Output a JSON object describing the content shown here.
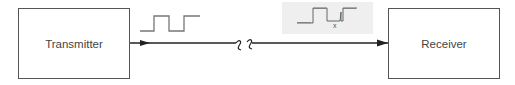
{
  "diagram": {
    "nodes": [
      {
        "id": "transmitter",
        "label": "Transmitter"
      },
      {
        "id": "receiver",
        "label": "Receiver"
      }
    ],
    "edges": [
      {
        "from": "transmitter",
        "to": "receiver",
        "style": "arrow",
        "break": "channel-break (wavy)"
      }
    ],
    "signals": {
      "transmitted": {
        "type": "clean square wave"
      },
      "received": {
        "type": "noisy square wave",
        "marker": "x"
      }
    },
    "colors": {
      "line": "#222222",
      "box_border": "#555555",
      "wave": "#777777",
      "noise_panel": "#efefef"
    }
  }
}
